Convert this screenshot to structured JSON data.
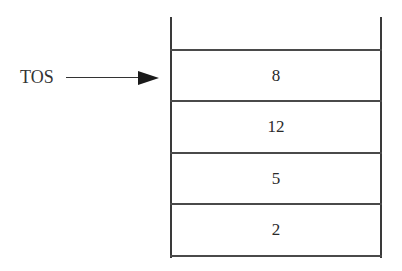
{
  "diagram": {
    "type": "stack",
    "pointer": {
      "label": "TOS",
      "points_to_index": 0
    },
    "cells": [
      {
        "value": "8"
      },
      {
        "value": "12"
      },
      {
        "value": "5"
      },
      {
        "value": "2"
      }
    ],
    "empty_top_slot": true
  },
  "colors": {
    "line": "#3a3a3a",
    "text": "#2a2a2a",
    "background": "#ffffff"
  }
}
